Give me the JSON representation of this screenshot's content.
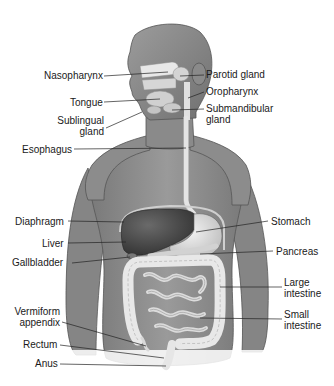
{
  "diagram": {
    "colors": {
      "skin": "#8a8a8a",
      "skin_dark": "#6a6a6a",
      "skin_light": "#a8a8a8",
      "organ_light": "#e6e6e6",
      "liver": "#4a4a4a",
      "line": "#222222",
      "text": "#1a1a1a"
    },
    "labels_left": [
      {
        "id": "nasopharynx",
        "text": "Nasopharynx",
        "x": 44,
        "y": 70
      },
      {
        "id": "tongue",
        "text": "Tongue",
        "x": 70,
        "y": 97
      },
      {
        "id": "sublingual-gland",
        "line1": "Sublingual",
        "line2": "gland",
        "x": 57,
        "y": 119
      },
      {
        "id": "esophagus",
        "text": "Esophagus",
        "x": 22,
        "y": 144
      },
      {
        "id": "diaphragm",
        "text": "Diaphragm",
        "x": 15,
        "y": 216
      },
      {
        "id": "liver",
        "text": "Liver",
        "x": 42,
        "y": 238
      },
      {
        "id": "gallbladder",
        "text": "Gallbladder",
        "x": 12,
        "y": 257
      },
      {
        "id": "vermiform-appendix",
        "line1": "Vermiform",
        "line2": "appendix",
        "x": 12,
        "y": 306
      },
      {
        "id": "rectum",
        "text": "Rectum",
        "x": 23,
        "y": 339
      },
      {
        "id": "anus",
        "text": "Anus",
        "x": 35,
        "y": 358
      }
    ],
    "labels_right": [
      {
        "id": "parotid-gland",
        "text": "Parotid gland",
        "x": 206,
        "y": 69
      },
      {
        "id": "oropharynx",
        "text": "Oropharynx",
        "x": 206,
        "y": 86
      },
      {
        "id": "submandibular-gland",
        "line1": "Submandibular",
        "line2": "gland",
        "x": 206,
        "y": 103
      },
      {
        "id": "stomach",
        "text": "Stomach",
        "x": 271,
        "y": 216
      },
      {
        "id": "pancreas",
        "text": "Pancreas",
        "x": 276,
        "y": 246
      },
      {
        "id": "large-intestine",
        "line1": "Large",
        "line2": "intestine",
        "x": 284,
        "y": 277
      },
      {
        "id": "small-intestine",
        "line1": "Small",
        "line2": "intestine",
        "x": 284,
        "y": 309
      }
    ]
  }
}
